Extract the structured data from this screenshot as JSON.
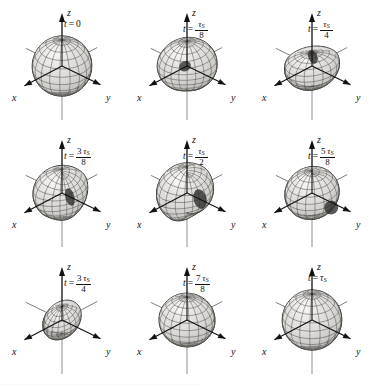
{
  "figure": {
    "type": "scientific-figure",
    "rows": 3,
    "columns": 3,
    "background_color": "#ffffff",
    "ink_color": "#111111",
    "surface_fill": "#d8d6d2",
    "surface_shadow": "#2b2b2b"
  },
  "axes": {
    "x_label": "x",
    "y_label": "y",
    "z_label": "z"
  },
  "panels": [
    {
      "id": "panel-1",
      "time_label": {
        "lhs": "t",
        "eq": "=",
        "whole": "0",
        "numerator": null,
        "denominator": null
      },
      "shape": "sphere",
      "elongation_axis": "none",
      "aspect": {
        "rx": 1.0,
        "ry": 1.0,
        "rz": 1.0
      },
      "tilt_deg": 0,
      "dimple": "none"
    },
    {
      "id": "panel-2",
      "time_label": {
        "lhs": "t",
        "eq": "=",
        "whole": null,
        "numerator": "τS",
        "denominator": "8"
      },
      "shape": "oblate-tilted",
      "elongation_axis": "x",
      "aspect": {
        "rx": 1.05,
        "ry": 0.92,
        "rz": 0.95
      },
      "tilt_deg": -12,
      "dimple": "upper-right"
    },
    {
      "id": "panel-3",
      "time_label": {
        "lhs": "t",
        "eq": "=",
        "whole": null,
        "numerator": "τS",
        "denominator": "4"
      },
      "shape": "oblate-flattened",
      "elongation_axis": "x",
      "aspect": {
        "rx": 1.0,
        "ry": 0.8,
        "rz": 0.78
      },
      "tilt_deg": -6,
      "dimple": "top-center"
    },
    {
      "id": "panel-4",
      "time_label": {
        "lhs": "t",
        "eq": "=",
        "whole": null,
        "numerator": "3 τS",
        "denominator": "8"
      },
      "shape": "toroidal-concave",
      "elongation_axis": "x",
      "aspect": {
        "rx": 1.0,
        "ry": 0.95,
        "rz": 0.9
      },
      "tilt_deg": 0,
      "dimple": "center-deep"
    },
    {
      "id": "panel-5",
      "time_label": {
        "lhs": "t",
        "eq": "=",
        "whole": null,
        "numerator": "τS",
        "denominator": "2"
      },
      "shape": "sphere-concave-front",
      "elongation_axis": "none",
      "aspect": {
        "rx": 1.05,
        "ry": 1.0,
        "rz": 1.0
      },
      "tilt_deg": 0,
      "dimple": "front-right"
    },
    {
      "id": "panel-6",
      "time_label": {
        "lhs": "t",
        "eq": "=",
        "whole": null,
        "numerator": "5 τS",
        "denominator": "8"
      },
      "shape": "oblate-tilted",
      "elongation_axis": "x",
      "aspect": {
        "rx": 1.0,
        "ry": 0.88,
        "rz": 0.85
      },
      "tilt_deg": 14,
      "dimple": "lower-right"
    },
    {
      "id": "panel-7",
      "time_label": {
        "lhs": "t",
        "eq": "=",
        "whole": null,
        "numerator": "3 τS",
        "denominator": "4"
      },
      "shape": "flat-ellipsoid",
      "elongation_axis": "xy-diagonal",
      "aspect": {
        "rx": 1.0,
        "ry": 0.58,
        "rz": 0.52
      },
      "tilt_deg": 24,
      "dimple": "none"
    },
    {
      "id": "panel-8",
      "time_label": {
        "lhs": "t",
        "eq": "=",
        "whole": null,
        "numerator": "7 τS",
        "denominator": "8"
      },
      "shape": "prolate",
      "elongation_axis": "y",
      "aspect": {
        "rx": 0.92,
        "ry": 0.95,
        "rz": 0.88
      },
      "tilt_deg": 8,
      "dimple": "none"
    },
    {
      "id": "panel-9",
      "time_label": {
        "lhs": "t",
        "eq": "=",
        "whole": "τS",
        "numerator": null,
        "denominator": null
      },
      "shape": "sphere",
      "elongation_axis": "none",
      "aspect": {
        "rx": 1.0,
        "ry": 1.0,
        "rz": 1.0
      },
      "tilt_deg": 0,
      "dimple": "none"
    }
  ],
  "footer": {
    "clipped_caption": "·········································································"
  }
}
